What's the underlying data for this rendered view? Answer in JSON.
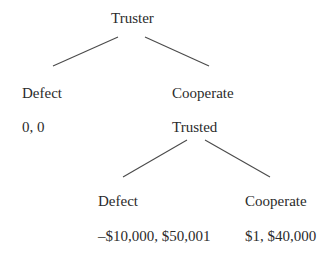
{
  "diagram": {
    "type": "game-tree",
    "root": {
      "player": "Truster",
      "branches": [
        {
          "action": "Defect",
          "payoff": "0, 0"
        },
        {
          "action": "Cooperate",
          "next_player": "Trusted",
          "branches": [
            {
              "action": "Defect",
              "payoff": "–$10,000, $50,001"
            },
            {
              "action": "Cooperate",
              "payoff": "$1, $40,000"
            }
          ]
        }
      ]
    }
  },
  "colors": {
    "text": "#2b2b2b",
    "lines": "#4a4a4a",
    "background": "#ffffff"
  }
}
